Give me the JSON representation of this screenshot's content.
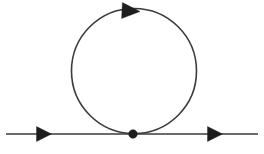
{
  "figure": {
    "kind": "feynman-diagram",
    "name": "one-loop self-energy tadpole diagram",
    "caption": "",
    "width": 264,
    "height": 154,
    "background_color": "#ffffff",
    "line_color": "#3b3b3b",
    "marker_color": "#1d1d1d"
  },
  "chart_data": {
    "type": "diagram",
    "title": "",
    "subtitle": "",
    "xlabel": "",
    "ylabel": "",
    "grid": false,
    "legend": [],
    "annotations": [],
    "elements": [
      {
        "id": "incoming-propagator",
        "role": "external-line",
        "shape": "line",
        "x1": 6,
        "y1": 134,
        "x2": 133,
        "y2": 134,
        "stroke": "#3b3b3b",
        "stroke_width": 1.7,
        "label": ""
      },
      {
        "id": "outgoing-propagator",
        "role": "external-line",
        "shape": "line",
        "x1": 133,
        "y1": 134,
        "x2": 258,
        "y2": 134,
        "stroke": "#3b3b3b",
        "stroke_width": 1.7,
        "label": ""
      },
      {
        "id": "loop",
        "role": "internal-loop",
        "shape": "circle",
        "cx": 134,
        "cy": 71,
        "r": 62.5,
        "stroke": "#3b3b3b",
        "stroke_width": 1.6,
        "label": ""
      },
      {
        "id": "vertex",
        "role": "interaction-vertex",
        "shape": "dot",
        "cx": 133,
        "cy": 134,
        "r": 4.3,
        "fill": "#1d1d1d",
        "label": ""
      }
    ],
    "arrows": [
      {
        "id": "arrow-incoming",
        "on": "incoming-propagator",
        "cx": 44,
        "cy": 134,
        "direction": "right",
        "angle_deg": 0,
        "length": 15,
        "half_width": 7.5,
        "fill": "#1d1d1d"
      },
      {
        "id": "arrow-loop-top",
        "on": "loop",
        "cx": 131,
        "cy": 11,
        "direction": "right",
        "angle_deg": 3,
        "length": 18,
        "half_width": 8,
        "fill": "#1d1d1d"
      },
      {
        "id": "arrow-outgoing",
        "on": "outgoing-propagator",
        "cx": 215,
        "cy": 134,
        "direction": "right",
        "angle_deg": 0,
        "length": 15,
        "half_width": 7.5,
        "fill": "#1d1d1d"
      }
    ]
  },
  "accessibility": {
    "description": "Feynman diagram: a straight horizontal fermion line running left to right with arrowheads on the left and right segments, meeting at a single filled vertex dot in the middle, from which a closed circular loop rises upward carrying an arrowhead pointing clockwise at the top."
  }
}
